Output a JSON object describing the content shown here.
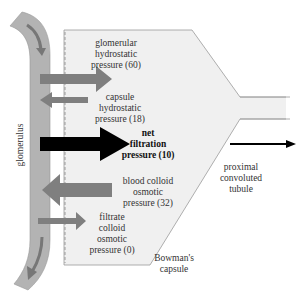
{
  "diagram": {
    "colors": {
      "glomerulus_fill": "#b3b3b3",
      "capsule_fill": "#efefef",
      "capsule_stroke": "#9a9a9a",
      "pressure_arrow": "#7f7f7f",
      "net_arrow": "#000000",
      "flow_arrow": "#777777"
    },
    "structures": {
      "glomerulus": "glomerulus",
      "bowmans_capsule": "Bowman's\ncapsule",
      "proximal_tubule": "proximal\nconvoluted\ntubule"
    },
    "pressures": [
      {
        "id": "glomerular-hydrostatic",
        "label": "glomerular\nhydrostatic\npressure (60)",
        "value": 60,
        "direction": "into-capsule"
      },
      {
        "id": "capsule-hydrostatic",
        "label": "capsule\nhydrostatic\npressure (18)",
        "value": 18,
        "direction": "into-glomerulus"
      },
      {
        "id": "net-filtration",
        "label": "net\nfiltration\npressure (10)",
        "value": 10,
        "direction": "into-capsule"
      },
      {
        "id": "blood-colloid-osmotic",
        "label": "blood colloid\nosmotic\npressure (32)",
        "value": 32,
        "direction": "into-glomerulus"
      },
      {
        "id": "filtrate-colloid-osmotic",
        "label": "filtrate\ncolloid\nosmotic\npressure (0)",
        "value": 0,
        "direction": "into-capsule"
      }
    ]
  }
}
